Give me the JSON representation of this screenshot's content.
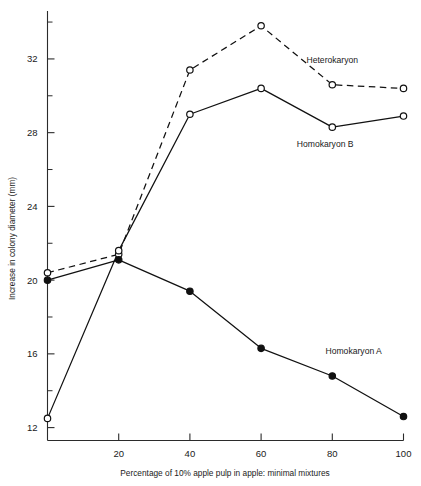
{
  "chart_data": {
    "type": "line",
    "title": "",
    "xlabel": "Percentage of 10% apple pulp in apple: minimal mixtures",
    "ylabel": "Increase in colony diameter (mm)",
    "x": [
      0,
      20,
      40,
      60,
      80,
      100
    ],
    "xlim": [
      0,
      100
    ],
    "ylim": [
      11.3,
      34.6
    ],
    "xticks": [
      20,
      40,
      60,
      80,
      100
    ],
    "xticklabels": [
      "20",
      "40",
      "60",
      "80",
      "100"
    ],
    "yticks": [
      12,
      16,
      20,
      24,
      28,
      32
    ],
    "yticklabels": [
      "12",
      "16",
      "20",
      "24",
      "28",
      "32"
    ],
    "yminorticks": [
      14,
      18,
      22,
      26,
      30,
      34
    ],
    "grid": false,
    "legend_position": "inline-annotations",
    "series": [
      {
        "name": "Heterokaryon",
        "values": [
          20.4,
          21.4,
          31.4,
          33.8,
          30.6,
          30.4
        ],
        "linestyle": "dashed",
        "marker": "open-circle",
        "color": "#111111",
        "label_x": 80,
        "label_y": 31.8
      },
      {
        "name": "Homokaryon B",
        "values": [
          12.5,
          21.6,
          29.0,
          30.4,
          28.3,
          28.9
        ],
        "linestyle": "solid",
        "marker": "open-circle",
        "color": "#111111",
        "label_x": 78,
        "label_y": 27.2
      },
      {
        "name": "Homokaryon A",
        "values": [
          20.0,
          21.1,
          19.4,
          16.3,
          14.8,
          12.6
        ],
        "linestyle": "solid",
        "marker": "filled-circle",
        "color": "#111111",
        "label_x": 86,
        "label_y": 16.0
      }
    ],
    "annotations": [
      {
        "text": "Heterokaryon",
        "x": 80,
        "y": 31.8
      },
      {
        "text": "Homokaryon B",
        "x": 78,
        "y": 27.2
      },
      {
        "text": "Homokaryon A",
        "x": 86,
        "y": 16.0
      }
    ]
  }
}
